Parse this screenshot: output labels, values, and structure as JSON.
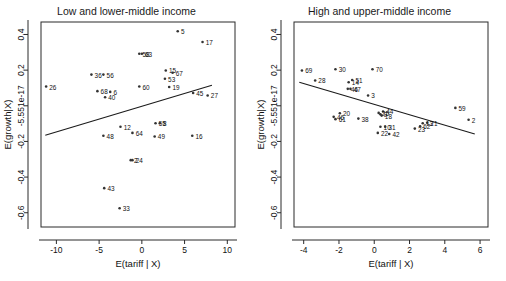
{
  "figure": {
    "type": "scatter-matrix",
    "panel_count": 2,
    "background": "#ffffff",
    "point_color": "#333333",
    "line_color": "#1a1a1a"
  },
  "chart_data": [
    {
      "type": "scatter",
      "title": "Low and lower-middle income",
      "xlabel": "E(tariff | X)",
      "ylabel": "E(growth|X)",
      "xlim": [
        -11.8,
        10.9
      ],
      "ylim": [
        -0.68,
        0.47
      ],
      "xticks": [
        -10,
        -5,
        0,
        5,
        10
      ],
      "xtick_labels": [
        "-10",
        "-5",
        "0",
        "5",
        "10"
      ],
      "yticks": [
        0.4,
        0.2,
        0.0,
        -0.2,
        -0.4,
        -0.6
      ],
      "ytick_labels": [
        "0.4",
        "0.2",
        "-5.551e-17",
        "-0.2",
        "-0.4",
        "-0.6"
      ],
      "grid": false,
      "legend": "none",
      "fit_line": {
        "x": [
          -11.3,
          8.2
        ],
        "y": [
          -0.165,
          0.115
        ]
      },
      "points": [
        {
          "label": "26",
          "x": -11.2,
          "y": 0.108
        },
        {
          "label": "36",
          "x": -5.9,
          "y": 0.175
        },
        {
          "label": "56",
          "x": -4.5,
          "y": 0.175
        },
        {
          "label": "68",
          "x": -5.2,
          "y": 0.082
        },
        {
          "label": "6",
          "x": -3.7,
          "y": 0.078
        },
        {
          "label": "40",
          "x": -4.3,
          "y": 0.048
        },
        {
          "label": "48",
          "x": -4.5,
          "y": -0.168
        },
        {
          "label": "12",
          "x": -2.5,
          "y": -0.118
        },
        {
          "label": "64",
          "x": -1.1,
          "y": -0.152
        },
        {
          "label": "43",
          "x": -4.4,
          "y": -0.462
        },
        {
          "label": "33",
          "x": -2.6,
          "y": -0.575
        },
        {
          "label": "24",
          "x": -1.1,
          "y": -0.305
        },
        {
          "label": "2",
          "x": -1.3,
          "y": -0.305
        },
        {
          "label": "60",
          "x": -0.3,
          "y": 0.108
        },
        {
          "label": "63",
          "x": 0.0,
          "y": 0.292
        },
        {
          "label": "58",
          "x": -0.3,
          "y": 0.292
        },
        {
          "label": "5",
          "x": 4.2,
          "y": 0.418
        },
        {
          "label": "17",
          "x": 7.1,
          "y": 0.358
        },
        {
          "label": "15",
          "x": 2.8,
          "y": 0.198
        },
        {
          "label": "67",
          "x": 3.6,
          "y": 0.185
        },
        {
          "label": "53",
          "x": 2.7,
          "y": 0.152
        },
        {
          "label": "19",
          "x": 3.2,
          "y": 0.105
        },
        {
          "label": "45",
          "x": 6.0,
          "y": 0.072
        },
        {
          "label": "27",
          "x": 7.7,
          "y": 0.058
        },
        {
          "label": "55",
          "x": 1.6,
          "y": -0.098
        },
        {
          "label": "8",
          "x": 2.1,
          "y": -0.098
        },
        {
          "label": "49",
          "x": 1.5,
          "y": -0.172
        },
        {
          "label": "16",
          "x": 5.9,
          "y": -0.168
        }
      ]
    },
    {
      "type": "scatter",
      "title": "High and upper-middle income",
      "xlabel": "E(tariff | X)",
      "ylabel": "E(growth|X)",
      "xlim": [
        -4.55,
        6.45
      ],
      "ylim": [
        -0.68,
        0.47
      ],
      "xticks": [
        -4,
        -2,
        0,
        2,
        4,
        6
      ],
      "xtick_labels": [
        "-4",
        "-2",
        "0",
        "2",
        "4",
        "6"
      ],
      "yticks": [
        0.4,
        0.2,
        0.0,
        -0.2,
        -0.4,
        -0.6
      ],
      "ytick_labels": [
        "0.4",
        "0.2",
        "-5.551e-17",
        "-0.2",
        "-0.4",
        "-0.6"
      ],
      "grid": false,
      "legend": "none",
      "fit_line": {
        "x": [
          -4.25,
          5.7
        ],
        "y": [
          0.132,
          -0.158
        ]
      },
      "points": [
        {
          "label": "69",
          "x": -4.1,
          "y": 0.198
        },
        {
          "label": "28",
          "x": -3.35,
          "y": 0.142
        },
        {
          "label": "30",
          "x": -2.2,
          "y": 0.205
        },
        {
          "label": "70",
          "x": -0.1,
          "y": 0.205
        },
        {
          "label": "14",
          "x": -1.45,
          "y": 0.132
        },
        {
          "label": "51",
          "x": -1.25,
          "y": 0.145
        },
        {
          "label": "46",
          "x": -1.5,
          "y": 0.095
        },
        {
          "label": "47",
          "x": -1.35,
          "y": 0.095
        },
        {
          "label": "3",
          "x": -0.35,
          "y": 0.058
        },
        {
          "label": "20",
          "x": -1.95,
          "y": -0.042
        },
        {
          "label": "46b",
          "x": -2.3,
          "y": -0.062
        },
        {
          "label": "61",
          "x": -2.2,
          "y": -0.075
        },
        {
          "label": "38",
          "x": -0.9,
          "y": -0.072
        },
        {
          "label": "44",
          "x": 0.5,
          "y": -0.032
        },
        {
          "label": "9",
          "x": 0.35,
          "y": -0.048
        },
        {
          "label": "25",
          "x": 0.25,
          "y": -0.04
        },
        {
          "label": "18",
          "x": 0.42,
          "y": -0.055
        },
        {
          "label": "10",
          "x": 0.35,
          "y": -0.118
        },
        {
          "label": "31",
          "x": 0.62,
          "y": -0.118
        },
        {
          "label": "22",
          "x": 0.2,
          "y": -0.152
        },
        {
          "label": "42",
          "x": 0.85,
          "y": -0.158
        },
        {
          "label": "23",
          "x": 2.3,
          "y": -0.128
        },
        {
          "label": "62",
          "x": 2.6,
          "y": -0.115
        },
        {
          "label": "21",
          "x": 3.0,
          "y": -0.095
        },
        {
          "label": "13",
          "x": 2.75,
          "y": -0.098
        },
        {
          "label": "59",
          "x": 4.6,
          "y": -0.012
        },
        {
          "label": "2",
          "x": 5.35,
          "y": -0.078
        }
      ]
    }
  ]
}
